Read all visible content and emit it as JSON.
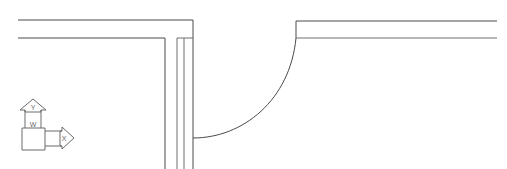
{
  "drawing": {
    "title": "Wall Plan Fragment",
    "background_color": "#ffffff",
    "line_color": "#4a4a4a",
    "line_color_soft": "#6e6e6e",
    "width": 507,
    "height": 169,
    "description": "Architectural plan fragment: two horizontal wall runs meeting a vertical wall, joined by a large filleted (curved) corner."
  },
  "geometry": {
    "top_left_wall_outer": {
      "name": "top-left-outer-wall-line",
      "points": "18,20 193,20 193,169"
    },
    "top_left_wall_inner": {
      "name": "top-left-inner-wall-line",
      "points": "18,38 165,38 165,169"
    },
    "vertical_wall_left_edge": {
      "name": "vertical-wall-left-edge",
      "points": "177,38 177,169"
    },
    "vertical_wall_right_edge": {
      "name": "vertical-wall-right-edge",
      "points": "184,38 184,169"
    },
    "vertical_wall_cap": {
      "name": "vertical-wall-top-cap",
      "points": "177,38 193,38"
    },
    "fillet_curve": {
      "name": "fillet-curve",
      "path": "M 193,138 C 243,138 290,100 296,38",
      "start": [
        193,
        138
      ],
      "end": [
        296,
        38
      ],
      "radius_hint": 100
    },
    "right_wall_outer": {
      "name": "right-outer-wall-line",
      "points": "296,21 497,21"
    },
    "right_wall_inner": {
      "name": "right-inner-wall-line",
      "points": "296,38 497,38"
    },
    "right_wall_end_vertical": {
      "name": "right-wall-corner-vertical",
      "points": "296,21 296,38"
    }
  },
  "ucs_icon": {
    "name": "ucs-axis-icon",
    "y_axis_label": "Y",
    "x_axis_label": "X",
    "world_marker_label": "W",
    "stroke_color": "#6a6a6a",
    "origin": [
      22,
      142
    ],
    "y_arrow_tip": [
      33,
      100
    ],
    "x_arrow_tip": [
      74,
      137
    ]
  }
}
